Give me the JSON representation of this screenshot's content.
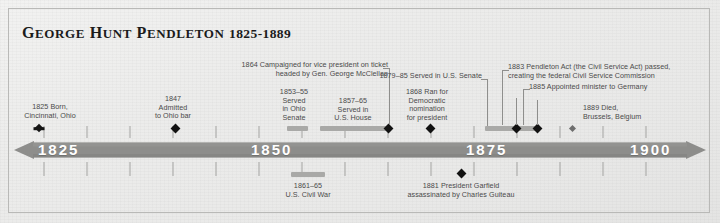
{
  "header": {
    "name": "George Hunt Pendleton",
    "life_span": "1825-1889"
  },
  "axis": {
    "start_year": 1825,
    "end_year": 1900,
    "decade_labels": [
      "1825",
      "1850",
      "1875",
      "1900"
    ],
    "minor_tick_interval_years": 5,
    "bar_color": "#8d8d8b",
    "label_color": "#ffffff"
  },
  "events": {
    "born": "1825 Born,\nCincinnati, Ohio",
    "ohio_bar": "1847\nAdmitted\nto Ohio bar",
    "ohio_senate": "1853–55\nServed\nin Ohio\nSenate",
    "us_house": "1857–65\nServed in\nU.S. House",
    "vp_campaign": "1864 Campaigned for vice president on ticket\nheaded by Gen. George McClellan",
    "dem_nomination": "1868 Ran for\nDemocratic\nnomination\nfor president",
    "us_senate": "1879–85 Served in U.S. Senate",
    "pendleton_act": "1883 Pendleton Act (the Civil Service Act) passed,\ncreating the federal Civil Service Commission",
    "minister_germany": "1885 Appointed minister to Germany",
    "died": "1889 Died,\nBrussels, Belgium",
    "civil_war": "1861–65\nU.S. Civil War",
    "garfield": "1881 President Garfield\nassassinated by Charles Guiteau"
  },
  "colors": {
    "paper": "#ececeb",
    "ink": "#1b1b1b",
    "note_text": "#4a4a4a",
    "marker": "#121212",
    "span": "#a9a9a7"
  }
}
